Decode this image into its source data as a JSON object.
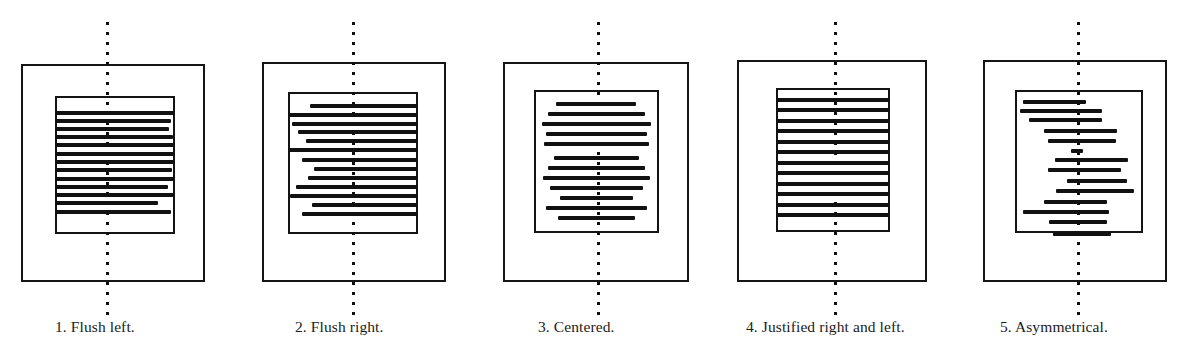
{
  "figure": {
    "background_color": "#ffffff",
    "ink_color": "#111111",
    "axis_style": "vertical dotted center axis",
    "panel_count": 5
  },
  "panels": [
    {
      "number": "1",
      "caption": "1. Flush left.",
      "caption_left": 55,
      "page_frame": {
        "x": 21,
        "y": 64,
        "w": 184,
        "h": 218
      },
      "text_frame": {
        "x": 55,
        "y": 96,
        "w": 120,
        "h": 138
      },
      "axis_x": 106,
      "alignment": "left",
      "lines": [
        {
          "top": 15,
          "left": 0,
          "width": 120,
          "h": 4.0
        },
        {
          "top": 23,
          "left": 0,
          "width": 116,
          "h": 3.6
        },
        {
          "top": 31,
          "left": 0,
          "width": 114,
          "h": 4.2
        },
        {
          "top": 39,
          "left": 0,
          "width": 118,
          "h": 3.8
        },
        {
          "top": 47,
          "left": 0,
          "width": 120,
          "h": 4.4
        },
        {
          "top": 56,
          "left": 0,
          "width": 119,
          "h": 3.8
        },
        {
          "top": 64,
          "left": 0,
          "width": 120,
          "h": 4.0
        },
        {
          "top": 72,
          "left": 0,
          "width": 117,
          "h": 4.2
        },
        {
          "top": 81,
          "left": 0,
          "width": 120,
          "h": 3.8
        },
        {
          "top": 89,
          "left": 0,
          "width": 113,
          "h": 4.0
        },
        {
          "top": 97,
          "left": 0,
          "width": 119,
          "h": 3.6
        },
        {
          "top": 105,
          "left": 0,
          "width": 103,
          "h": 4.4
        },
        {
          "top": 114,
          "left": 0,
          "width": 116,
          "h": 3.8
        }
      ]
    },
    {
      "number": "2",
      "caption": "2. Flush right.",
      "caption_left": 295,
      "page_frame": {
        "x": 262,
        "y": 62,
        "w": 184,
        "h": 220
      },
      "text_frame": {
        "x": 288,
        "y": 92,
        "w": 130,
        "h": 142
      },
      "axis_x": 352,
      "alignment": "right",
      "lines": [
        {
          "top": 12,
          "left": 22,
          "width": 108,
          "h": 3.6
        },
        {
          "top": 21,
          "left": 0,
          "width": 130,
          "h": 4.2
        },
        {
          "top": 30,
          "left": 4,
          "width": 126,
          "h": 3.8
        },
        {
          "top": 38,
          "left": 10,
          "width": 120,
          "h": 4.2
        },
        {
          "top": 47,
          "left": 18,
          "width": 112,
          "h": 3.8
        },
        {
          "top": 56,
          "left": 0,
          "width": 130,
          "h": 4.4
        },
        {
          "top": 66,
          "left": 14,
          "width": 116,
          "h": 3.8
        },
        {
          "top": 75,
          "left": 26,
          "width": 104,
          "h": 4.2
        },
        {
          "top": 84,
          "left": 20,
          "width": 110,
          "h": 3.8
        },
        {
          "top": 93,
          "left": 8,
          "width": 122,
          "h": 4.2
        },
        {
          "top": 102,
          "left": 2,
          "width": 128,
          "h": 4.0
        },
        {
          "top": 111,
          "left": 24,
          "width": 106,
          "h": 3.8
        },
        {
          "top": 120,
          "left": 14,
          "width": 116,
          "h": 4.2
        }
      ]
    },
    {
      "number": "3",
      "caption": "3. Centered.",
      "caption_left": 538,
      "page_frame": {
        "x": 503,
        "y": 62,
        "w": 186,
        "h": 220
      },
      "text_frame": {
        "x": 534,
        "y": 90,
        "w": 125,
        "h": 143
      },
      "axis_x": 597,
      "alignment": "center",
      "lines": [
        {
          "top": 12,
          "left": 22,
          "width": 80,
          "h": 3.8
        },
        {
          "top": 22,
          "left": 14,
          "width": 97,
          "h": 4.4
        },
        {
          "top": 32,
          "left": 8,
          "width": 109,
          "h": 4.0
        },
        {
          "top": 42,
          "left": 12,
          "width": 101,
          "h": 3.8
        },
        {
          "top": 52,
          "left": 10,
          "width": 105,
          "h": 4.2
        },
        {
          "top": 66,
          "left": 20,
          "width": 85,
          "h": 3.8
        },
        {
          "top": 76,
          "left": 14,
          "width": 97,
          "h": 4.2
        },
        {
          "top": 86,
          "left": 9,
          "width": 107,
          "h": 4.0
        },
        {
          "top": 96,
          "left": 16,
          "width": 93,
          "h": 3.8
        },
        {
          "top": 106,
          "left": 26,
          "width": 73,
          "h": 4.0
        },
        {
          "top": 116,
          "left": 12,
          "width": 101,
          "h": 4.2
        },
        {
          "top": 126,
          "left": 24,
          "width": 77,
          "h": 3.8
        }
      ]
    },
    {
      "number": "4",
      "caption": "4. Justified right and left.",
      "caption_left": 746,
      "page_frame": {
        "x": 737,
        "y": 60,
        "w": 190,
        "h": 222
      },
      "text_frame": {
        "x": 776,
        "y": 88,
        "w": 114,
        "h": 144
      },
      "axis_x": 834,
      "alignment": "justify",
      "lines": [
        {
          "top": 10,
          "left": 0,
          "width": 114,
          "h": 4.4
        },
        {
          "top": 20,
          "left": 0,
          "width": 114,
          "h": 4.4
        },
        {
          "top": 31,
          "left": 0,
          "width": 114,
          "h": 4.4
        },
        {
          "top": 41,
          "left": 0,
          "width": 114,
          "h": 4.4
        },
        {
          "top": 52,
          "left": 0,
          "width": 114,
          "h": 4.4
        },
        {
          "top": 62,
          "left": 0,
          "width": 114,
          "h": 4.4
        },
        {
          "top": 73,
          "left": 0,
          "width": 114,
          "h": 4.4
        },
        {
          "top": 83,
          "left": 0,
          "width": 114,
          "h": 4.4
        },
        {
          "top": 94,
          "left": 0,
          "width": 114,
          "h": 4.4
        },
        {
          "top": 104,
          "left": 0,
          "width": 114,
          "h": 4.4
        },
        {
          "top": 115,
          "left": 0,
          "width": 114,
          "h": 4.4
        },
        {
          "top": 125,
          "left": 0,
          "width": 114,
          "h": 4.4
        }
      ]
    },
    {
      "number": "5",
      "caption": "5. Asymmetrical.",
      "caption_left": 1000,
      "page_frame": {
        "x": 983,
        "y": 60,
        "w": 184,
        "h": 222
      },
      "text_frame": {
        "x": 1015,
        "y": 90,
        "w": 128,
        "h": 143
      },
      "axis_x": 1077,
      "alignment": "asymmetrical",
      "lines": [
        {
          "top": 10,
          "left": 8,
          "width": 63,
          "h": 3.8
        },
        {
          "top": 19,
          "left": 5,
          "width": 82,
          "h": 4.4
        },
        {
          "top": 28,
          "left": 14,
          "width": 73,
          "h": 4.0
        },
        {
          "top": 39,
          "left": 29,
          "width": 73,
          "h": 4.0
        },
        {
          "top": 49,
          "left": 33,
          "width": 68,
          "h": 4.2
        },
        {
          "top": 59,
          "left": 56,
          "width": 12,
          "h": 3.6
        },
        {
          "top": 68,
          "left": 40,
          "width": 73,
          "h": 4.4
        },
        {
          "top": 78,
          "left": 33,
          "width": 73,
          "h": 4.0
        },
        {
          "top": 89,
          "left": 52,
          "width": 60,
          "h": 4.2
        },
        {
          "top": 99,
          "left": 41,
          "width": 78,
          "h": 4.4
        },
        {
          "top": 110,
          "left": 29,
          "width": 63,
          "h": 3.8
        },
        {
          "top": 120,
          "left": 8,
          "width": 86,
          "h": 4.2
        },
        {
          "top": 130,
          "left": 34,
          "width": 58,
          "h": 4.0
        },
        {
          "top": 142,
          "left": 38,
          "width": 58,
          "h": 4.0
        }
      ]
    }
  ]
}
